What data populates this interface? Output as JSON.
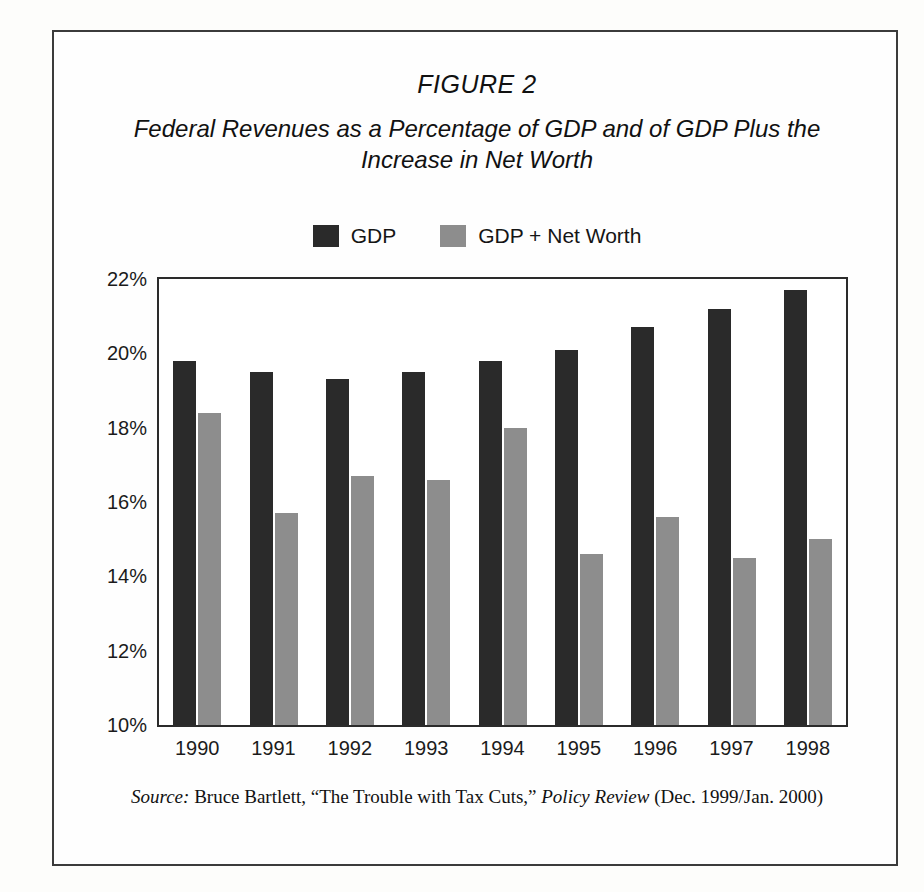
{
  "figure": {
    "label": "FIGURE 2",
    "title": "Federal Revenues as a Percentage of GDP and of GDP Plus the Increase in Net Worth"
  },
  "source": {
    "prefix": "Source:",
    "author": " Bruce Bartlett, “The Trouble with Tax Cuts,” ",
    "publication": "Policy Review",
    "date": " (Dec. 1999/Jan. 2000)"
  },
  "colors": {
    "gdp": "#2a2a2a",
    "gdp_plus_net_worth": "#8d8d8d",
    "axis": "#2b2b2b",
    "frame": "#3b3b3b",
    "text": "#1b1b1b",
    "background": "#fefefe"
  },
  "chart_data": {
    "type": "bar",
    "title": "Federal Revenues as a Percentage of GDP and of GDP Plus the Increase in Net Worth",
    "subtitle": "FIGURE 2",
    "xlabel": "",
    "ylabel": "",
    "ylim": [
      10,
      22
    ],
    "ytick_labels": [
      "22%",
      "20%",
      "18%",
      "16%",
      "14%",
      "12%",
      "10%"
    ],
    "ytick_values": [
      22,
      20,
      18,
      16,
      14,
      12,
      10
    ],
    "grid": false,
    "legend_position": "top-center",
    "categories": [
      "1990",
      "1991",
      "1992",
      "1993",
      "1994",
      "1995",
      "1996",
      "1997",
      "1998"
    ],
    "series": [
      {
        "name": "GDP",
        "color": "#2a2a2a",
        "values": [
          19.8,
          19.5,
          19.3,
          19.5,
          19.8,
          20.1,
          20.7,
          21.2,
          21.7
        ]
      },
      {
        "name": "GDP + Net Worth",
        "color": "#8d8d8d",
        "values": [
          18.4,
          15.7,
          16.7,
          16.6,
          18.0,
          14.6,
          15.6,
          14.5,
          15.0
        ]
      }
    ]
  }
}
